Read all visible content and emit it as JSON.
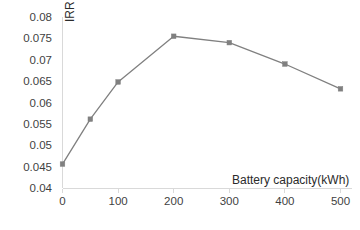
{
  "chart_data": {
    "type": "line",
    "title": "",
    "xlabel": "Battery capacity(kWh)",
    "ylabel": "IRR (%)",
    "x": [
      0,
      50,
      100,
      200,
      300,
      400,
      500
    ],
    "values": [
      0.0456,
      0.0561,
      0.0648,
      0.0755,
      0.074,
      0.069,
      0.0632
    ],
    "series": [
      {
        "name": "IRR",
        "values": [
          0.0456,
          0.0561,
          0.0648,
          0.0755,
          0.074,
          0.069,
          0.0632
        ]
      }
    ],
    "xlim": [
      0,
      500
    ],
    "ylim": [
      0.04,
      0.08
    ],
    "x_ticks": [
      0,
      100,
      200,
      300,
      400,
      500
    ],
    "x_tick_labels": [
      "0",
      "100",
      "200",
      "300",
      "400",
      "500"
    ],
    "y_ticks": [
      0.04,
      0.045,
      0.05,
      0.055,
      0.06,
      0.065,
      0.07,
      0.075,
      0.08
    ],
    "y_tick_labels": [
      "0.04",
      "0.045",
      "0.05",
      "0.055",
      "0.06",
      "0.065",
      "0.07",
      "0.075",
      "0.08"
    ],
    "grid": false,
    "legend": "none",
    "marker": "square",
    "series_color": "#808080",
    "axis_color": "#d9d9d9",
    "text_color": "#3f3f3f"
  }
}
